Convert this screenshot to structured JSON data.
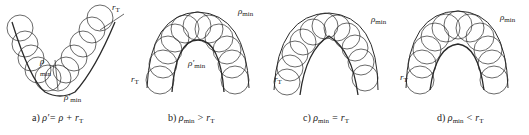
{
  "figure": {
    "panels": [
      {
        "id": "a",
        "caption_prefix": "a)",
        "caption_formula": "ρ′= ρ + r",
        "caption_sub": "T",
        "labels": {
          "r_t": "r",
          "r_t_sub": "T",
          "rho_min": "ρ",
          "rho_min_sub": "min",
          "rho_min_prime": "ρ′",
          "rho_min_prime_sub": "min"
        }
      },
      {
        "id": "b",
        "caption_prefix": "b)",
        "caption_formula": "ρ",
        "caption_mid_sub": "min",
        "caption_rel": "> r",
        "caption_sub": "T",
        "labels": {
          "rho_min": "ρ",
          "rho_min_sub": "min",
          "rho_min_prime": "ρ′",
          "rho_min_prime_sub": "min",
          "r_t": "r",
          "r_t_sub": "T"
        }
      },
      {
        "id": "c",
        "caption_prefix": "c)",
        "caption_formula": "ρ",
        "caption_mid_sub": "min",
        "caption_rel": "= r",
        "caption_sub": "T",
        "labels": {
          "rho_min": "ρ",
          "rho_min_sub": "min",
          "r_t": "r",
          "r_t_sub": "T"
        }
      },
      {
        "id": "d",
        "caption_prefix": "d)",
        "caption_formula": "ρ",
        "caption_mid_sub": "min",
        "caption_rel": "< r",
        "caption_sub": "T",
        "labels": {
          "rho_min": "ρ",
          "rho_min_sub": "min",
          "r_t": "r",
          "r_t_sub": "T"
        }
      }
    ],
    "colors": {
      "line": "#2a2a2a",
      "background": "#ffffff"
    }
  }
}
